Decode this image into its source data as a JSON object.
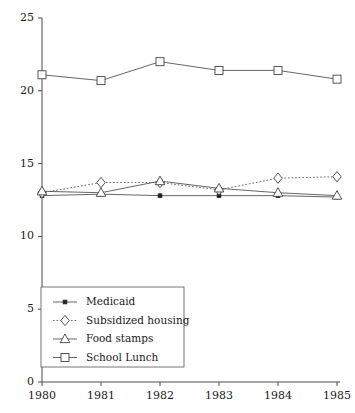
{
  "chart_data": {
    "type": "line",
    "title": "",
    "subtitle": "",
    "xlabel": "",
    "ylabel": "",
    "categories": [
      "1980",
      "1981",
      "1982",
      "1983",
      "1984",
      "1985"
    ],
    "x": [
      1980,
      1981,
      1982,
      1983,
      1984,
      1985
    ],
    "xlim": [
      1980,
      1985
    ],
    "ylim": [
      0,
      25
    ],
    "y_ticks": [
      "0",
      "5",
      "10",
      "15",
      "20",
      "25"
    ],
    "y_tick_values": [
      0,
      5,
      10,
      15,
      20,
      25
    ],
    "x_ticks": [
      "1980",
      "1981",
      "1982",
      "1983",
      "1984",
      "1985"
    ],
    "grid": false,
    "legend_position": "lower-left-inside",
    "series": [
      {
        "name": "Medicaid",
        "marker": "filled-square-small",
        "linestyle": "solid",
        "values": [
          12.8,
          12.9,
          12.8,
          12.8,
          12.8,
          12.7
        ]
      },
      {
        "name": "Subsidized housing",
        "marker": "diamond",
        "linestyle": "dotted",
        "values": [
          13.0,
          13.7,
          13.7,
          13.2,
          14.0,
          14.1
        ]
      },
      {
        "name": "Food stamps",
        "marker": "triangle-up",
        "linestyle": "solid",
        "values": [
          13.1,
          13.0,
          13.8,
          13.3,
          13.0,
          12.8
        ]
      },
      {
        "name": "School Lunch",
        "marker": "square",
        "linestyle": "solid",
        "values": [
          21.1,
          20.7,
          22.0,
          21.4,
          21.4,
          20.8
        ]
      }
    ],
    "legend_entries": [
      "Medicaid",
      "Subsidized housing",
      "Food stamps",
      "School Lunch"
    ],
    "colors": {
      "axis": "#4a4a4a",
      "line": "#555555",
      "marker_fill": "#ffffff",
      "marker_stroke": "#444444",
      "background": "#ffffff"
    }
  }
}
